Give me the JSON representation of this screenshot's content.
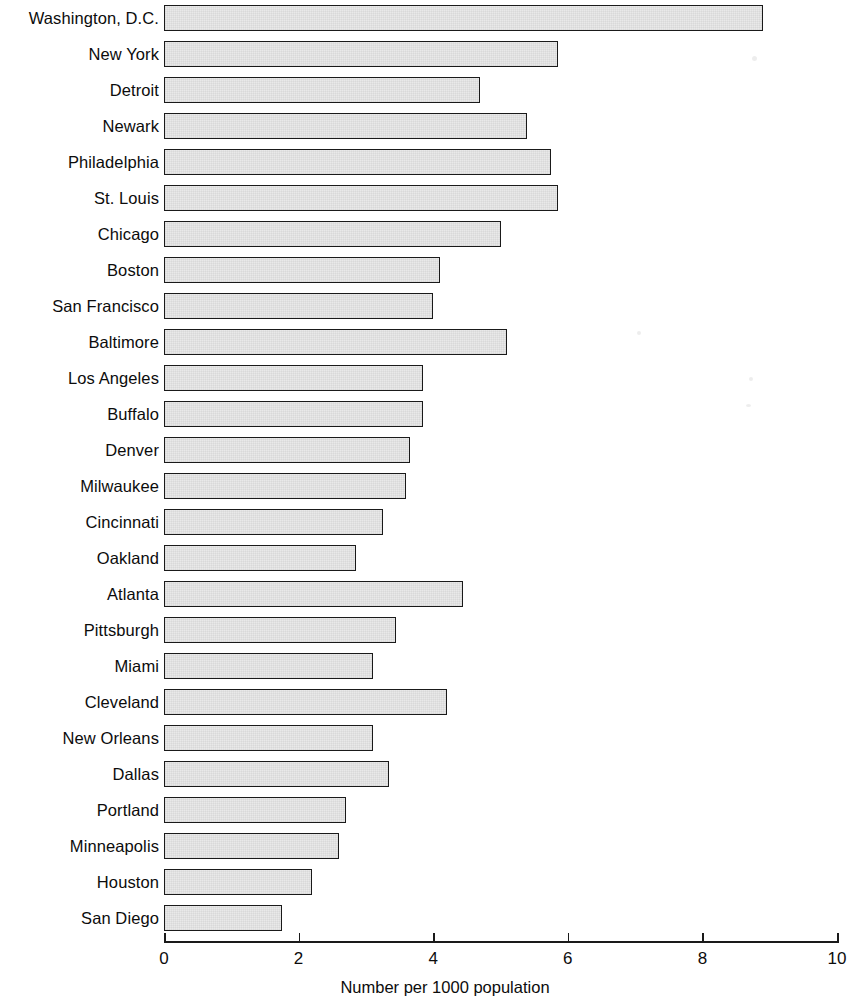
{
  "chart_data": {
    "type": "bar",
    "orientation": "horizontal",
    "title": "",
    "xlabel": "Number per 1000 population",
    "ylabel": "",
    "xlim": [
      0,
      10
    ],
    "xticks": [
      0,
      2,
      4,
      6,
      8,
      10
    ],
    "xtick_labels": [
      "0",
      "2",
      "4",
      "6",
      "8",
      "10"
    ],
    "grid": false,
    "legend": null,
    "bar_fill_color": "#e9e9e9",
    "bar_edge_color": "#1a1a1a",
    "background_color": "#ffffff",
    "categories": [
      "Washington, D.C.",
      "New York",
      "Detroit",
      "Newark",
      "Philadelphia",
      "St. Louis",
      "Chicago",
      "Boston",
      "San Francisco",
      "Baltimore",
      "Los Angeles",
      "Buffalo",
      "Denver",
      "Milwaukee",
      "Cincinnati",
      "Oakland",
      "Atlanta",
      "Pittsburgh",
      "Miami",
      "Cleveland",
      "New Orleans",
      "Dallas",
      "Portland",
      "Minneapolis",
      "Houston",
      "San Diego"
    ],
    "values": [
      8.9,
      5.85,
      4.7,
      5.4,
      5.75,
      5.85,
      5.0,
      4.1,
      4.0,
      5.1,
      3.85,
      3.85,
      3.65,
      3.6,
      3.25,
      2.85,
      4.45,
      3.45,
      3.1,
      4.2,
      3.1,
      3.35,
      2.7,
      2.6,
      2.2,
      1.75
    ]
  },
  "axis": {
    "x_label": "Number per 1000 population"
  }
}
